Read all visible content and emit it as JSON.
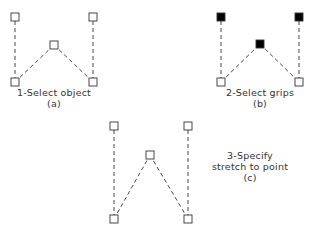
{
  "panels": [
    {
      "id": "a",
      "caption": "1-Select object",
      "sub": "(a)",
      "grips": [
        {
          "x": 15,
          "y": 17,
          "filled": false
        },
        {
          "x": 93,
          "y": 17,
          "filled": false
        },
        {
          "x": 54,
          "y": 45,
          "filled": false
        },
        {
          "x": 15,
          "y": 82,
          "filled": false
        },
        {
          "x": 93,
          "y": 82,
          "filled": false
        }
      ]
    },
    {
      "id": "b",
      "caption": "2-Select grips",
      "sub": "(b)",
      "grips": [
        {
          "x": 221,
          "y": 17,
          "filled": true
        },
        {
          "x": 299,
          "y": 17,
          "filled": true
        },
        {
          "x": 260,
          "y": 44,
          "filled": true
        },
        {
          "x": 221,
          "y": 82,
          "filled": false
        },
        {
          "x": 299,
          "y": 82,
          "filled": false
        }
      ]
    },
    {
      "id": "c",
      "caption_line1": "3-Specify",
      "caption_line2": "stretch to point",
      "sub": "(c)",
      "grips": [
        {
          "x": 114,
          "y": 126,
          "filled": false
        },
        {
          "x": 188,
          "y": 126,
          "filled": false
        },
        {
          "x": 150,
          "y": 155,
          "filled": false
        },
        {
          "x": 114,
          "y": 219,
          "filled": false
        },
        {
          "x": 188,
          "y": 219,
          "filled": false
        }
      ]
    }
  ],
  "colors": {
    "line": "#333333",
    "grip_fill": "#000000"
  }
}
